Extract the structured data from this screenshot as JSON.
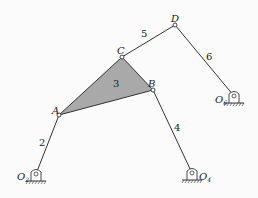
{
  "diagram": {
    "type": "six-bar linkage mechanism",
    "colors": {
      "link": "#333333",
      "ternary_fill": "#a9a9a9",
      "background": "#fbfbfb"
    },
    "joints": {
      "A": {
        "label": "A",
        "x": 59,
        "y": 115
      },
      "B": {
        "label": "B",
        "x": 153,
        "y": 90
      },
      "C": {
        "label": "C",
        "x": 122,
        "y": 57
      },
      "D": {
        "label": "D",
        "x": 175,
        "y": 25
      }
    },
    "ground_pivots": {
      "O2": {
        "label": "O",
        "sub": "2",
        "x": 36,
        "y": 177
      },
      "O4": {
        "label": "O",
        "sub": "4",
        "x": 192,
        "y": 176
      },
      "O6": {
        "label": "O",
        "sub": "6",
        "x": 234,
        "y": 99
      }
    },
    "links": [
      {
        "id": "2",
        "label": "2",
        "from": "O2",
        "to": "A"
      },
      {
        "id": "3",
        "label": "3",
        "type": "ternary",
        "joints": [
          "A",
          "B",
          "C"
        ]
      },
      {
        "id": "4",
        "label": "4",
        "from": "B",
        "to": "O4"
      },
      {
        "id": "5",
        "label": "5",
        "from": "C",
        "to": "D"
      },
      {
        "id": "6",
        "label": "6",
        "from": "D",
        "to": "O6"
      }
    ]
  }
}
